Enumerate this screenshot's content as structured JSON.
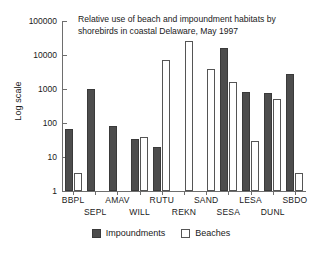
{
  "chart_data": {
    "type": "bar",
    "title": "Relative use of beach and impoundment habitats by shorebirds in coastal Delaware, May 1997",
    "xlabel": "",
    "ylabel": "Log scale",
    "scale": "log",
    "ylim": [
      1,
      100000
    ],
    "ytick_labels": [
      "1",
      "10",
      "100",
      "1000",
      "10000",
      "100000"
    ],
    "yticks": [
      1,
      10,
      100,
      1000,
      10000,
      100000
    ],
    "grid": false,
    "legend_position": "bottom-center",
    "categories": [
      "BBPL",
      "SEPL",
      "AMAV",
      "WILL",
      "RUTU",
      "REKN",
      "SAND",
      "SESA",
      "LESA",
      "DUNL",
      "SBDO"
    ],
    "series": [
      {
        "name": "Impoundments",
        "color": "#4d4d4d",
        "values": [
          65,
          1000,
          80,
          35,
          20,
          0,
          0,
          16000,
          800,
          750,
          2700
        ]
      },
      {
        "name": "Beaches",
        "color": "#ffffff",
        "values": [
          3.5,
          0,
          0,
          38,
          7000,
          25000,
          4000,
          1600,
          30,
          520,
          3.5
        ]
      }
    ]
  },
  "legend": {
    "items": [
      {
        "label": "Impoundments",
        "swatch": "filled-dark"
      },
      {
        "label": "Beaches",
        "swatch": "outline-white"
      }
    ]
  }
}
